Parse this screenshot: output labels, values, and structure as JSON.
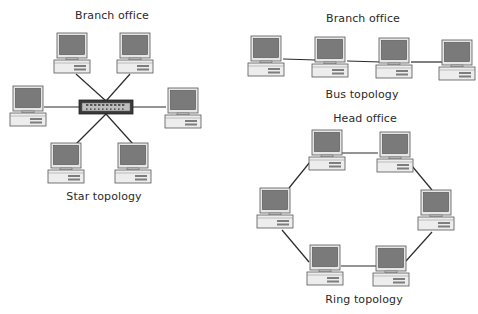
{
  "colors": {
    "background": "#ffffff",
    "line": "#2b2b2b",
    "screen": "#7a7a7a",
    "bezel": "#e6e6e6",
    "outline": "#555555",
    "base": "#ededed",
    "switch_outer": "#3a3a3a",
    "switch_inner": "#bdbdbd"
  },
  "labels": [
    {
      "id": "star-title",
      "text": "Branch office",
      "x": 112,
      "y": 9
    },
    {
      "id": "star-caption",
      "text": "Star topology",
      "x": 104,
      "y": 190
    },
    {
      "id": "bus-title",
      "text": "Branch office",
      "x": 363,
      "y": 12
    },
    {
      "id": "bus-caption",
      "text": "Bus topology",
      "x": 362,
      "y": 88
    },
    {
      "id": "ring-title",
      "text": "Head office",
      "x": 365,
      "y": 112
    },
    {
      "id": "ring-caption",
      "text": "Ring topology",
      "x": 364,
      "y": 293
    }
  ],
  "topologies": {
    "star": {
      "name": "Star topology",
      "hub": {
        "x": 106,
        "y": 107,
        "w": 54,
        "h": 14
      },
      "computers": [
        {
          "id": "star-pc-1",
          "x": 54,
          "y": 33
        },
        {
          "id": "star-pc-2",
          "x": 117,
          "y": 33
        },
        {
          "id": "star-pc-3",
          "x": 10,
          "y": 86
        },
        {
          "id": "star-pc-4",
          "x": 165,
          "y": 88
        },
        {
          "id": "star-pc-5",
          "x": 48,
          "y": 143
        },
        {
          "id": "star-pc-6",
          "x": 115,
          "y": 143
        }
      ],
      "links": [
        {
          "from": [
            76,
            74
          ],
          "to": [
            106,
            101
          ]
        },
        {
          "from": [
            130,
            74
          ],
          "to": [
            106,
            101
          ]
        },
        {
          "from": [
            44,
            107
          ],
          "to": [
            79,
            107
          ]
        },
        {
          "from": [
            133,
            107
          ],
          "to": [
            166,
            107
          ]
        },
        {
          "from": [
            76,
            144
          ],
          "to": [
            106,
            114
          ]
        },
        {
          "from": [
            133,
            144
          ],
          "to": [
            106,
            114
          ]
        }
      ]
    },
    "bus": {
      "name": "Bus topology",
      "computers": [
        {
          "id": "bus-pc-1",
          "x": 248,
          "y": 36
        },
        {
          "id": "bus-pc-2",
          "x": 312,
          "y": 37
        },
        {
          "id": "bus-pc-3",
          "x": 376,
          "y": 38
        },
        {
          "id": "bus-pc-4",
          "x": 439,
          "y": 40
        }
      ],
      "links": [
        {
          "from": [
            283,
            59
          ],
          "to": [
            316,
            60
          ]
        },
        {
          "from": [
            347,
            61
          ],
          "to": [
            381,
            62
          ]
        },
        {
          "from": [
            411,
            62
          ],
          "to": [
            443,
            62
          ]
        }
      ]
    },
    "ring": {
      "name": "Ring topology",
      "computers": [
        {
          "id": "ring-pc-1",
          "x": 309,
          "y": 130
        },
        {
          "id": "ring-pc-2",
          "x": 377,
          "y": 132
        },
        {
          "id": "ring-pc-3",
          "x": 257,
          "y": 188
        },
        {
          "id": "ring-pc-4",
          "x": 418,
          "y": 190
        },
        {
          "id": "ring-pc-5",
          "x": 307,
          "y": 245
        },
        {
          "id": "ring-pc-6",
          "x": 373,
          "y": 246
        }
      ],
      "links": [
        {
          "from": [
            342,
            153
          ],
          "to": [
            378,
            153
          ]
        },
        {
          "from": [
            407,
            160
          ],
          "to": [
            432,
            190
          ]
        },
        {
          "from": [
            310,
            162
          ],
          "to": [
            289,
            188
          ]
        },
        {
          "from": [
            282,
            230
          ],
          "to": [
            309,
            262
          ]
        },
        {
          "from": [
            432,
            232
          ],
          "to": [
            406,
            261
          ]
        },
        {
          "from": [
            341,
            266
          ],
          "to": [
            376,
            266
          ]
        }
      ]
    }
  }
}
